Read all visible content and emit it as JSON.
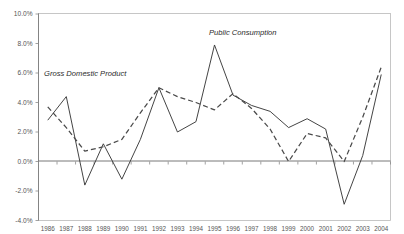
{
  "chart_data": {
    "type": "line",
    "title": "",
    "subtitle": "",
    "xlabel": "",
    "ylabel": "",
    "grid": false,
    "legend_position": "inline-annotation",
    "x": [
      "1986",
      "1987",
      "1988",
      "1989",
      "1990",
      "1991",
      "1992",
      "1993",
      "1994",
      "1995",
      "1996",
      "1997",
      "1998",
      "1999",
      "2000",
      "2001",
      "2002",
      "2003",
      "2004"
    ],
    "ylim": [
      -4.0,
      10.0
    ],
    "ytick_labels": [
      "10.0%",
      "8.0%",
      "6.0%",
      "4.0%",
      "2.0%",
      "0.0%",
      "-2.0%",
      "-4.0%"
    ],
    "ytick_values": [
      10.0,
      8.0,
      6.0,
      4.0,
      2.0,
      0.0,
      -2.0,
      -4.0
    ],
    "series": [
      {
        "name": "Gross Domestic Product",
        "style": "solid",
        "color": "#3a3a3a",
        "values": [
          2.8,
          4.4,
          -1.6,
          1.2,
          -1.2,
          1.5,
          5.0,
          2.0,
          2.7,
          7.9,
          4.5,
          3.8,
          3.4,
          2.3,
          2.9,
          2.2,
          -2.9,
          0.4,
          5.9
        ]
      },
      {
        "name": "Public Consumption",
        "style": "dashed",
        "color": "#4a4a4a",
        "values": [
          3.7,
          2.3,
          0.7,
          1.0,
          1.5,
          3.3,
          5.0,
          4.4,
          4.0,
          3.5,
          4.6,
          3.6,
          2.2,
          0.0,
          1.9,
          1.6,
          0.0,
          3.0,
          6.4
        ]
      }
    ],
    "annotations": [
      {
        "text": "Gross Domestic Product",
        "x_px": 44,
        "y_px": 76
      },
      {
        "text": "Public Consumption",
        "x_px": 209,
        "y_px": 35
      }
    ]
  },
  "axis": {
    "y_labels": [
      "10.0%",
      "8.0%",
      "6.0%",
      "4.0%",
      "2.0%",
      "0.0%",
      "-2.0%",
      "-4.0%"
    ],
    "x_labels": [
      "1986",
      "1987",
      "1988",
      "1989",
      "1990",
      "1991",
      "1992",
      "1993",
      "1994",
      "1995",
      "1996",
      "1997",
      "1998",
      "1999",
      "2000",
      "2001",
      "2002",
      "2003",
      "2004"
    ]
  }
}
